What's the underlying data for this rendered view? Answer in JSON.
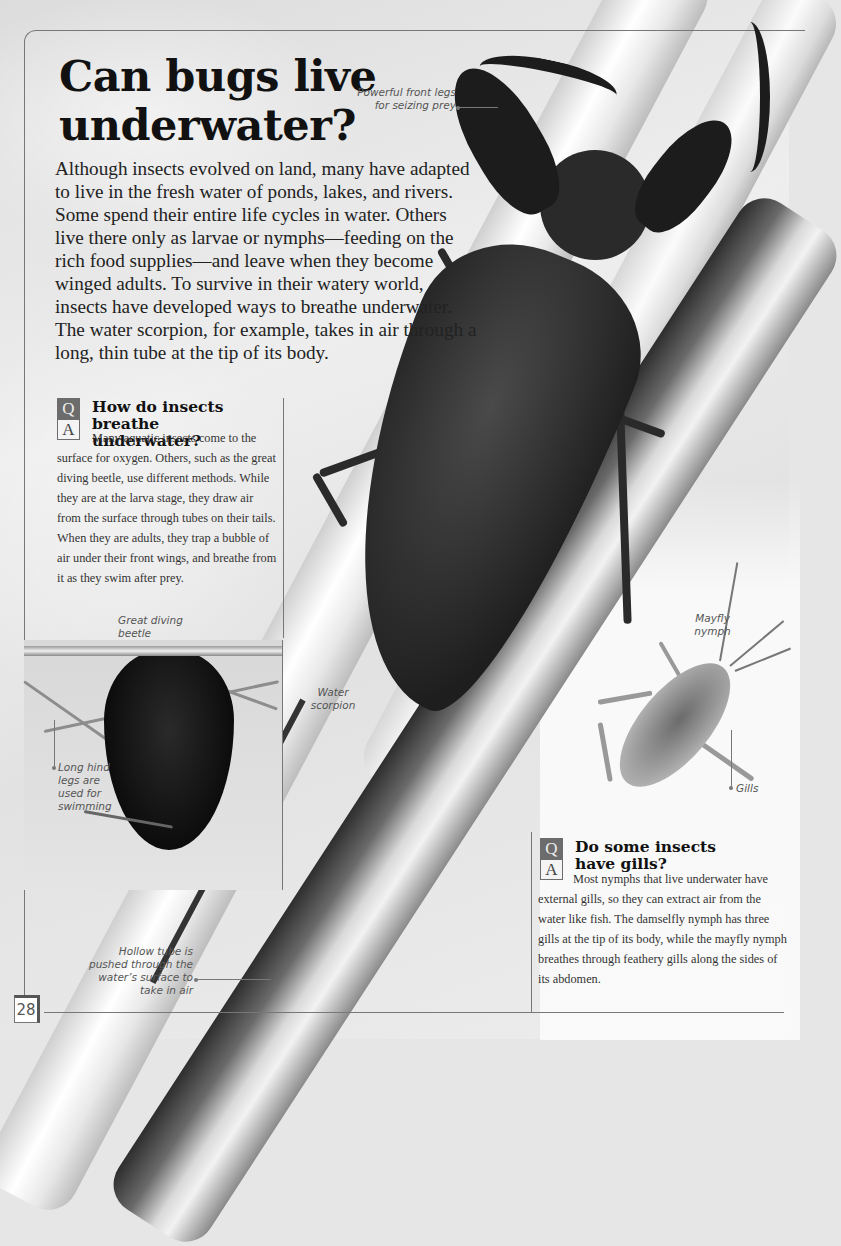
{
  "page": {
    "title": "Can bugs live underwater?",
    "page_number": "28"
  },
  "intro": "Although insects evolved on land, many have adapted to live in the fresh water of ponds, lakes, and rivers. Some spend their entire life cycles in water. Others live there only as larvae or nymphs—feeding on the rich food supplies—and leave when they become winged adults. To survive in their watery world, insects have developed ways to breathe underwater. The water scorpion, for example, takes in air through a long, thin tube at the tip of its body.",
  "captions": {
    "front_legs": "Powerful front legs for seizing prey",
    "water_scorpion": "Water scorpion",
    "great_diving_beetle": "Great diving beetle",
    "hind_legs": "Long hind legs are used for swimming",
    "hollow_tube": "Hollow tube is pushed through the water’s surface to take in air",
    "mayfly_nymph": "Mayfly nymph",
    "gills": "Gills"
  },
  "qa": [
    {
      "q_label": "Q",
      "a_label": "A",
      "question": "How do insects breathe underwater?",
      "answer": "Many aquatic insects come to the surface for oxygen. Others, such as the great diving beetle, use different methods. While they are at the larva stage, they draw air from the surface through tubes on their tails. When they are adults, they trap a bubble of air under their front wings, and breathe from it as they swim after prey."
    },
    {
      "q_label": "Q",
      "a_label": "A",
      "question": "Do some insects have gills?",
      "answer": "Most nymphs that live underwater have external gills, so they can extract air from the water like fish. The damselfly nymph has three gills at the tip of its body, while the mayfly nymph breathes through feathery gills along the sides of its abdomen."
    }
  ],
  "colors": {
    "qa_q_box": "#6c6c6c",
    "rule": "#777777",
    "title": "#111111"
  }
}
